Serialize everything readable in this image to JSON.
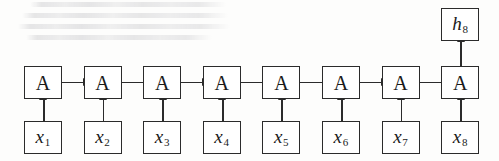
{
  "figure": {
    "type": "diagram",
    "name": "unrolled-recurrent-neural-network",
    "timestep_count": 8,
    "background_color": "#fdfdfc",
    "stroke_color": "#2b2b2b"
  },
  "output": {
    "label": "h",
    "subscript": "8"
  },
  "cells": [
    {
      "label": "A"
    },
    {
      "label": "A"
    },
    {
      "label": "A"
    },
    {
      "label": "A"
    },
    {
      "label": "A"
    },
    {
      "label": "A"
    },
    {
      "label": "A"
    },
    {
      "label": "A"
    }
  ],
  "inputs": [
    {
      "label": "x",
      "subscript": "1"
    },
    {
      "label": "x",
      "subscript": "2"
    },
    {
      "label": "x",
      "subscript": "3"
    },
    {
      "label": "x",
      "subscript": "4"
    },
    {
      "label": "x",
      "subscript": "5"
    },
    {
      "label": "x",
      "subscript": "6"
    },
    {
      "label": "x",
      "subscript": "7"
    },
    {
      "label": "x",
      "subscript": "8"
    }
  ],
  "geometry": {
    "box_width": 38,
    "box_height": 33,
    "first_box_left": 24,
    "pitch": 59.6,
    "cell_row_top": 66,
    "input_row_top": 121,
    "output_top": 8
  },
  "background_text_lines": [
    {
      "left": 30,
      "top": 2,
      "width": 196
    },
    {
      "left": 22,
      "top": 13,
      "width": 206
    },
    {
      "left": 18,
      "top": 24,
      "width": 212
    },
    {
      "left": 26,
      "top": 35,
      "width": 186
    }
  ]
}
